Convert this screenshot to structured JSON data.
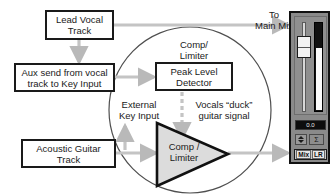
{
  "diagram": {
    "colors": {
      "box_border": "#1a1a1a",
      "box_fill": "#ffffff",
      "signal_arrow": "#c9c9c9",
      "circle_stroke": "#555555",
      "triangle_fill": "#d9d9d9",
      "triangle_stroke": "#1a1a1a",
      "mixer_body": "#8a8a8a",
      "text": "#1a1a1a"
    },
    "boxes": {
      "lead_vocal": {
        "line1": "Lead Vocal",
        "line2": "Track"
      },
      "aux_send": {
        "line1": "Aux send from vocal",
        "line2": "track to Key Input"
      },
      "acoustic_guitar": {
        "line1": "Acoustic Guitar",
        "line2": "Track"
      },
      "peak_level_detector": {
        "line1": "Peak Level",
        "line2": "Detector"
      }
    },
    "labels": {
      "comp_limiter_top": "Comp/\nLimiter",
      "to_main_mix": "To\nMain Mix",
      "external_key_input": "External\nKey Input",
      "vocals_duck": "Vocals “duck”\nguitar signal",
      "comp_limiter_triangle": "Comp /\nLimiter"
    },
    "connections": [
      {
        "name": "lead-vocal-to-main-mix",
        "from": "Lead Vocal Track",
        "to": "Main Mix",
        "style": "solid-arrow"
      },
      {
        "name": "lead-vocal-to-aux-send",
        "from": "Lead Vocal Track",
        "to": "Aux send from vocal track to Key Input",
        "style": "solid-arrow-down"
      },
      {
        "name": "aux-send-to-peak-level-detector",
        "from": "Aux send from vocal track to Key Input",
        "to": "Peak Level Detector",
        "style": "solid-arrow"
      },
      {
        "name": "guitar-to-comp-limiter",
        "from": "Acoustic Guitar Track",
        "to": "Comp / Limiter",
        "style": "solid-arrow"
      },
      {
        "name": "comp-limiter-to-main-mix",
        "from": "Comp / Limiter",
        "to": "Main Mix",
        "style": "solid-arrow"
      },
      {
        "name": "key-input-branch",
        "from": "Acoustic Guitar path",
        "to": "External Key Input",
        "style": "solid-arrow-up"
      },
      {
        "name": "detector-gain-control",
        "from": "Peak Level Detector",
        "to": "Comp / Limiter",
        "style": "dashed-arrow-down"
      }
    ]
  },
  "mixer": {
    "name": "channel-strip",
    "readout_value": "0.0",
    "pan_value": "Σ",
    "bus_label_left": "Mix",
    "bus_label_right": "LR",
    "fader_position_percent": 70,
    "meter_level_percent": 68
  }
}
